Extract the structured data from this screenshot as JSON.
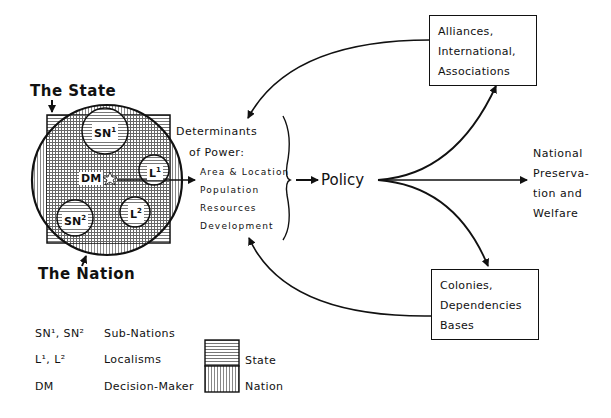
{
  "diagram": {
    "state_label": "The State",
    "nation_label": "The Nation",
    "tags": {
      "sn1": {
        "base": "SN",
        "sup": "1"
      },
      "sn2": {
        "base": "SN",
        "sup": "2"
      },
      "l1": {
        "base": "L",
        "sup": "1"
      },
      "l2": {
        "base": "L",
        "sup": "2"
      },
      "dm": "DM"
    },
    "determinants": {
      "title_line1": "Determinants",
      "title_line2": "of Power:",
      "items": [
        "Area & Location",
        "Population",
        "Resources",
        "Development"
      ]
    },
    "policy": "Policy",
    "outcome": [
      "National",
      "Preserva-",
      "tion and",
      "Welfare"
    ],
    "box_top": [
      "Alliances,",
      "International,",
      "Associations"
    ],
    "box_bottom": [
      "Colonies,",
      "Dependencies",
      "Bases"
    ]
  },
  "legend": {
    "rows": [
      {
        "abbr": "SN¹, SN²",
        "meaning": "Sub-Nations"
      },
      {
        "abbr": "L¹, L²",
        "meaning": "Localisms"
      },
      {
        "abbr": "DM",
        "meaning": "Decision-Maker"
      }
    ],
    "patterns": [
      {
        "label": "State",
        "pattern": "horizontal-lines"
      },
      {
        "label": "Nation",
        "pattern": "vertical-lines"
      }
    ]
  }
}
